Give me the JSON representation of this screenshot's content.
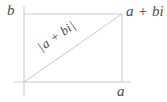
{
  "figure": {
    "kind": "complex-number-argand-diagram",
    "background_color": "#ffffff",
    "line_color": "#c9c9c9",
    "text_color": "#4a4a4a",
    "labels": {
      "imaginary_axis": "b",
      "real_axis": "a",
      "point": "a + bi",
      "modulus_expression": "a + bi",
      "modulus_bar": "|"
    }
  },
  "geometry": {
    "origin": {
      "x": 24,
      "y": 82
    },
    "point": {
      "x": 122,
      "y": 14
    },
    "vertical_axis": {
      "x": 24,
      "y1": 6,
      "y2": 95
    },
    "horizontal_axis": {
      "y": 82,
      "x1": 14,
      "x2": 131
    },
    "top_side": {
      "y": 14,
      "x1": 24,
      "x2": 122
    },
    "right_side": {
      "x": 122,
      "y1": 14,
      "y2": 82
    },
    "hypotenuse": {
      "x1": 24,
      "y1": 82,
      "x2": 122,
      "y2": 14
    }
  }
}
